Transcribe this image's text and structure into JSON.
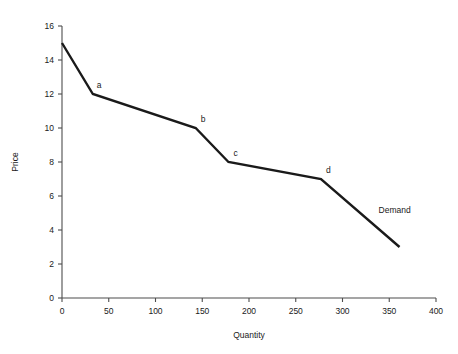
{
  "chart_data": {
    "type": "line",
    "title": "",
    "subtitle": "",
    "xlabel": "Quantity",
    "ylabel": "Price",
    "xlim": [
      0,
      400
    ],
    "ylim": [
      0,
      16
    ],
    "xticks": [
      0,
      50,
      100,
      150,
      200,
      250,
      300,
      350,
      400
    ],
    "yticks": [
      0,
      2,
      4,
      6,
      8,
      10,
      12,
      14,
      16
    ],
    "xtick_labels": [
      "0",
      "50",
      "100",
      "150",
      "200",
      "250",
      "300",
      "350",
      "400"
    ],
    "ytick_labels": [
      "0",
      "2",
      "4",
      "6",
      "8",
      "10",
      "12",
      "14",
      "16"
    ],
    "grid": false,
    "legend": "none",
    "series": [
      {
        "name": "Demand",
        "color": "#1a1a1a",
        "x": [
          0,
          33,
          143,
          178,
          277,
          361
        ],
        "y": [
          15,
          12,
          10,
          8,
          7,
          3
        ]
      }
    ],
    "annotations": [
      {
        "text": "a",
        "x": 33,
        "y": 12,
        "dx": 4,
        "dy": -4
      },
      {
        "text": "b",
        "x": 143,
        "y": 10,
        "dx": 5,
        "dy": -4
      },
      {
        "text": "c",
        "x": 178,
        "y": 8,
        "dx": 5,
        "dy": -4
      },
      {
        "text": "d",
        "x": 277,
        "y": 7,
        "dx": 5,
        "dy": -4
      },
      {
        "text": "Demand",
        "x": 330,
        "y": 4.9,
        "dx": 8,
        "dy": 0
      }
    ]
  },
  "axes": {
    "y_title": "Price",
    "x_title": "Quantity"
  },
  "labels": {
    "point_a": "a",
    "point_b": "b",
    "point_c": "c",
    "point_d": "d",
    "demand": "Demand"
  },
  "colors": {
    "curve": "#1a1a1a",
    "axis": "#4d4d4d",
    "text": "#1a1a1a",
    "background": "#ffffff"
  }
}
